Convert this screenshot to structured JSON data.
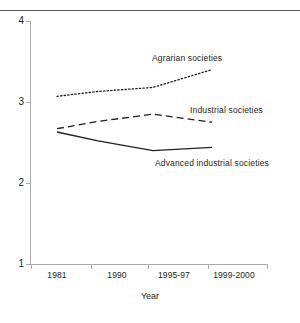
{
  "chart_data": {
    "type": "line",
    "title": "",
    "xlabel": "Year",
    "ylabel": "",
    "categories": [
      "1981",
      "1990",
      "1995-97",
      "1999-2000"
    ],
    "ylim": [
      1,
      4
    ],
    "yticks": [
      "1",
      "2",
      "3",
      "4"
    ],
    "grid": false,
    "legend_position": "inline-labels",
    "series": [
      {
        "name": "Agrarian societies",
        "style": "dotted",
        "values": [
          3.07,
          3.13,
          3.18,
          3.4
        ]
      },
      {
        "name": "Industrial societies",
        "style": "dashed",
        "values": [
          2.67,
          2.76,
          2.85,
          2.75
        ]
      },
      {
        "name": "Advanced industrial societies",
        "style": "solid",
        "values": [
          2.63,
          2.52,
          2.4,
          2.44
        ]
      }
    ],
    "annotations": [
      {
        "text": "Agrarian societies"
      },
      {
        "text": "Industrial societies"
      },
      {
        "text": "Advanced industrial societies"
      }
    ],
    "colors": {
      "line": "#231f20",
      "axis": "#a7a9ac",
      "rule": "#58595b"
    }
  },
  "axis": {
    "y_ticks": [
      "4",
      "3",
      "2",
      "1"
    ],
    "x_ticks": [
      "1981",
      "1990",
      "1995-97",
      "1999-2000"
    ],
    "x_title": "Year"
  },
  "labels": {
    "agrarian": "Agrarian societies",
    "industrial": "Industrial societies",
    "advanced": "Advanced industrial societies"
  }
}
